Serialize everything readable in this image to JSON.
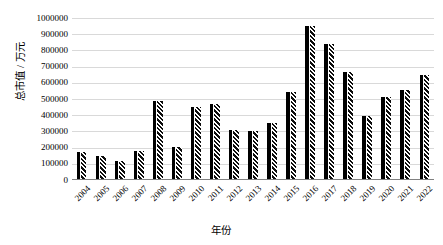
{
  "chart_data": {
    "type": "bar",
    "title": "",
    "xlabel": "年份",
    "ylabel": "总市值 / 万元",
    "categories": [
      "2004",
      "2005",
      "2006",
      "2007",
      "2008",
      "2009",
      "2010",
      "2011",
      "2012",
      "2013",
      "2014",
      "2015",
      "2016",
      "2017",
      "2018",
      "2019",
      "2020",
      "2021",
      "2022"
    ],
    "values": [
      165000,
      140000,
      110000,
      170000,
      480000,
      195000,
      445000,
      465000,
      305000,
      295000,
      345000,
      535000,
      945000,
      835000,
      660000,
      390000,
      505000,
      550000,
      640000
    ],
    "series": [
      {
        "name": "总市值",
        "values": [
          165000,
          140000,
          110000,
          170000,
          480000,
          195000,
          445000,
          465000,
          305000,
          295000,
          345000,
          535000,
          945000,
          835000,
          660000,
          390000,
          505000,
          550000,
          640000
        ]
      }
    ],
    "ylim": [
      0,
      1000000
    ],
    "ytick_values": [
      0,
      100000,
      200000,
      300000,
      400000,
      500000,
      600000,
      700000,
      800000,
      900000,
      1000000
    ],
    "ytick_labels": [
      "0",
      "100000",
      "200000",
      "300000",
      "400000",
      "500000",
      "600000",
      "700000",
      "800000",
      "900000",
      "1000000"
    ],
    "grid": true,
    "grid_axis": "y",
    "legend": false,
    "legend_position": "none",
    "bar_fill": "black-with-white-diagonal-hatch",
    "xtick_rotation": -45,
    "colors": {
      "bar_solid": "#000000",
      "bar_hatch_background": "#0d0d0d",
      "bar_hatch_stripe": "#ffffff",
      "gridline": "#d9d9d9",
      "axis": "#808080",
      "text": "#000000",
      "background": "#ffffff"
    }
  }
}
